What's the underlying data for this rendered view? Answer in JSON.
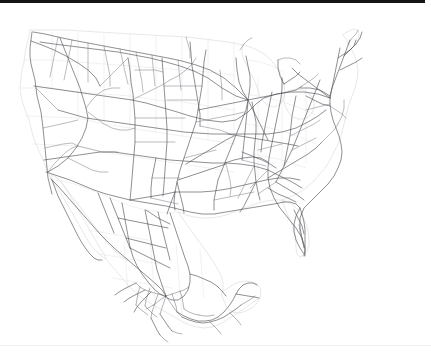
{
  "map": {
    "title": "North America Road Network",
    "region_label": "United States and Mexico",
    "background_color": "#ffffff",
    "road_color": "#4a4a52",
    "boundary_color": "#e2e2e4",
    "coastline_color": "#d8d8dc",
    "top_band_color": "#151515",
    "bottom_rule_color": "#eeeeee",
    "projection_note": "",
    "layers": [
      {
        "name": "coastline",
        "label": "Coastline",
        "color": "#d8d8dc",
        "visible": true
      },
      {
        "name": "boundaries",
        "label": "State and Country Boundaries",
        "color": "#e2e2e4",
        "visible": true
      },
      {
        "name": "roads",
        "label": "Major Highways",
        "color": "#4a4a52",
        "visible": true
      }
    ],
    "regions": [
      {
        "name": "pacific-northwest",
        "label": "Pacific Northwest"
      },
      {
        "name": "california",
        "label": "California"
      },
      {
        "name": "great-basin",
        "label": "Great Basin"
      },
      {
        "name": "rocky-mountains",
        "label": "Rocky Mountains"
      },
      {
        "name": "great-plains",
        "label": "Great Plains"
      },
      {
        "name": "midwest",
        "label": "Midwest"
      },
      {
        "name": "great-lakes",
        "label": "Great Lakes"
      },
      {
        "name": "new-england",
        "label": "New England"
      },
      {
        "name": "mid-atlantic",
        "label": "Mid-Atlantic"
      },
      {
        "name": "southeast",
        "label": "Southeast"
      },
      {
        "name": "florida",
        "label": "Florida"
      },
      {
        "name": "gulf-coast",
        "label": "Gulf Coast"
      },
      {
        "name": "texas",
        "label": "Texas"
      },
      {
        "name": "baja-california",
        "label": "Baja California"
      },
      {
        "name": "northern-mexico",
        "label": "Northern Mexico"
      },
      {
        "name": "central-mexico",
        "label": "Central Mexico"
      },
      {
        "name": "yucatan",
        "label": "Yucatan Peninsula"
      }
    ],
    "hubs": [
      {
        "name": "chicago-hub",
        "label": "Chicago",
        "x": 248,
        "y": 100
      },
      {
        "name": "dallas-hub",
        "label": "Dallas",
        "x": 177,
        "y": 182
      },
      {
        "name": "atlanta-hub",
        "label": "Atlanta",
        "x": 268,
        "y": 177
      },
      {
        "name": "kansas-city-hub",
        "label": "Kansas City",
        "x": 200,
        "y": 126
      },
      {
        "name": "mexico-city-hub",
        "label": "Mexico City",
        "x": 166,
        "y": 297
      },
      {
        "name": "denver-hub",
        "label": "Denver",
        "x": 135,
        "y": 127
      },
      {
        "name": "salt-lake-hub",
        "label": "Salt Lake City",
        "x": 88,
        "y": 112
      },
      {
        "name": "los-angeles-hub",
        "label": "Los Angeles",
        "x": 46,
        "y": 170
      },
      {
        "name": "new-york-hub",
        "label": "New York",
        "x": 330,
        "y": 106
      },
      {
        "name": "indianapolis-hub",
        "label": "Indianapolis",
        "x": 257,
        "y": 128
      },
      {
        "name": "memphis-hub",
        "label": "Memphis",
        "x": 225,
        "y": 163
      },
      {
        "name": "st-louis-hub",
        "label": "St. Louis",
        "x": 228,
        "y": 133
      }
    ]
  }
}
